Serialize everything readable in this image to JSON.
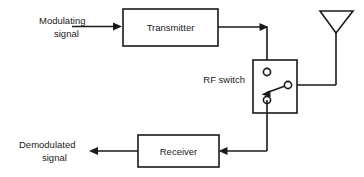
{
  "diagram": {
    "canvas": {
      "width": 364,
      "height": 177,
      "background": "#ffffff"
    },
    "stroke_color": "#1a1a1a",
    "labels": {
      "modulating_line1": "Modulating",
      "modulating_line2": "signal",
      "transmitter": "Transmitter",
      "rf_switch": "RF switch",
      "receiver": "Receiver",
      "demodulated_line1": "Demodulated",
      "demodulated_line2": "signal"
    },
    "blocks": [
      {
        "name": "transmitter",
        "label": "Transmitter",
        "x": 123,
        "y": 9,
        "w": 95,
        "h": 37
      },
      {
        "name": "rf-switch",
        "label": "RF switch",
        "x": 253,
        "y": 60,
        "w": 44,
        "h": 53
      },
      {
        "name": "receiver",
        "label": "Receiver",
        "x": 138,
        "y": 135,
        "w": 81,
        "h": 32
      }
    ],
    "antenna": {
      "name": "antenna",
      "shape": "downward-triangle",
      "left_x": 320,
      "right_x": 353,
      "top_y": 11,
      "apex_x": 336,
      "apex_y": 33,
      "stem_bottom_y": 85
    },
    "terminals": [
      {
        "name": "switch-terminal-transmit",
        "cx": 267,
        "cy": 72,
        "r": 3.6
      },
      {
        "name": "switch-terminal-receive",
        "cx": 267,
        "cy": 100,
        "r": 3.6
      },
      {
        "name": "switch-terminal-antenna",
        "cx": 288,
        "cy": 85,
        "r": 3.6
      }
    ],
    "switch_arm": {
      "name": "switch-arm",
      "from_x": 285,
      "from_y": 86,
      "to_x": 263,
      "to_y": 94,
      "pointing_to": "switch-terminal-receive"
    },
    "connections": [
      {
        "name": "modulating-input",
        "from": "Modulating signal",
        "to": "transmitter",
        "arrow": true
      },
      {
        "name": "transmitter-to-switch",
        "from": "transmitter",
        "to": "rf-switch",
        "arrow": true
      },
      {
        "name": "switch-to-antenna",
        "from": "rf-switch",
        "to": "antenna",
        "arrow": false
      },
      {
        "name": "switch-to-receiver",
        "from": "rf-switch",
        "to": "receiver",
        "arrow": true
      },
      {
        "name": "demodulated-output",
        "from": "receiver",
        "to": "Demodulated signal",
        "arrow": true
      }
    ]
  }
}
